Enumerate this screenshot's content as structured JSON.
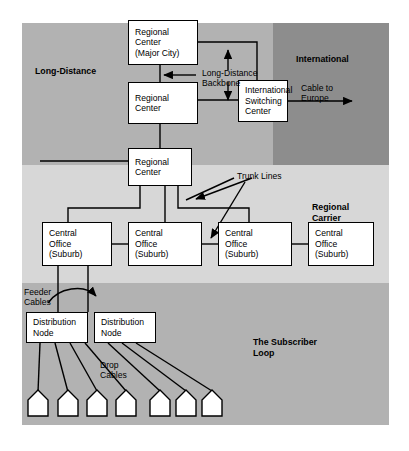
{
  "figure": {
    "background": "#ffffff"
  },
  "colors": {
    "long_distance_band": "#b2b2b2",
    "international_band": "#8d8d8d",
    "regional_band": "#d7d7d7",
    "subscriber_band": "#b2b2b2",
    "box_fill": "#ffffff",
    "line": "#000000"
  },
  "regions": [
    {
      "id": "long-distance",
      "label": "Long-Distance"
    },
    {
      "id": "international",
      "label": "International"
    },
    {
      "id": "regional-carrier",
      "label": "Regional\nCarrier",
      "line1": "Regional",
      "line2": "Carrier"
    },
    {
      "id": "subscriber-loop",
      "label": "The Subscriber\nLoop",
      "line1": "The Subscriber",
      "line2": "Loop"
    }
  ],
  "nodes": {
    "regional_center_major": {
      "lines": [
        "Regional",
        "Center",
        "(Major City)"
      ]
    },
    "regional_center_2": {
      "lines": [
        "Regional",
        "Center"
      ]
    },
    "intl_switching": {
      "lines": [
        "International",
        "Switching",
        "Center"
      ]
    },
    "regional_center_3": {
      "lines": [
        "Regional",
        "Center"
      ]
    },
    "central_office_1": {
      "lines": [
        "Central",
        "Office",
        "(Suburb)"
      ]
    },
    "central_office_2": {
      "lines": [
        "Central",
        "Office",
        "(Suburb)"
      ]
    },
    "central_office_3": {
      "lines": [
        "Central",
        "Office",
        "(Suburb)"
      ]
    },
    "central_office_4": {
      "lines": [
        "Central",
        "Office",
        "(Suburb)"
      ]
    },
    "distribution_node_1": {
      "lines": [
        "Distribution",
        "Node"
      ]
    },
    "distribution_node_2": {
      "lines": [
        "Distribution",
        "Node"
      ]
    }
  },
  "annotations": {
    "long_distance_backbone": {
      "line1": "Long-Distance",
      "line2": "Backbone"
    },
    "cable_to_europe": {
      "line1": "Cable to",
      "line2": "Europe"
    },
    "trunk_lines": {
      "line1": "Trunk Lines"
    },
    "feeder_cables": {
      "line1": "Feeder",
      "line2": "Cables"
    },
    "drop_cables": {
      "line1": "Drop",
      "line2": "Cables"
    }
  },
  "subscribers": {
    "count": 7,
    "group_left": 4,
    "group_right": 3
  }
}
